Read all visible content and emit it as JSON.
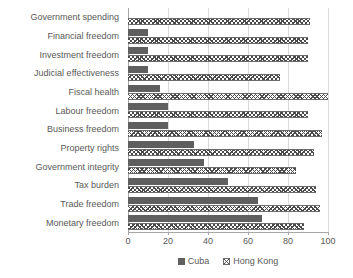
{
  "chart_data": {
    "type": "bar",
    "orientation": "horizontal",
    "title": "",
    "xlabel": "",
    "ylabel": "",
    "xlim": [
      0,
      100
    ],
    "xticks": [
      0,
      20,
      40,
      60,
      80,
      100
    ],
    "grid": true,
    "legend_position": "bottom",
    "categories": [
      "Government spending",
      "Financial freedom",
      "Investment freedom",
      "Judicial effectiveness",
      "Fiscal health",
      "Labour freedom",
      "Business freedom",
      "Property rights",
      "Government integrity",
      "Tax burden",
      "Trade freedom",
      "Monetary freedom"
    ],
    "series": [
      {
        "name": "Cuba",
        "color": "#5f5f5f",
        "pattern": "solid",
        "values": [
          0,
          10,
          10,
          10,
          16,
          20,
          20,
          33,
          38,
          50,
          65,
          67
        ]
      },
      {
        "name": "Hong Kong",
        "color": "#4a4a4a",
        "pattern": "crosshatch",
        "values": [
          91,
          90,
          90,
          76,
          100,
          90,
          97,
          93,
          84,
          94,
          96,
          88
        ]
      }
    ]
  },
  "legend": {
    "items": [
      {
        "label": "Cuba",
        "swatch": "solid-square-icon"
      },
      {
        "label": "Hong Kong",
        "swatch": "hatched-square-icon"
      }
    ]
  },
  "axis": {
    "x_tick_labels": [
      "0",
      "20",
      "40",
      "60",
      "80",
      "100"
    ]
  }
}
